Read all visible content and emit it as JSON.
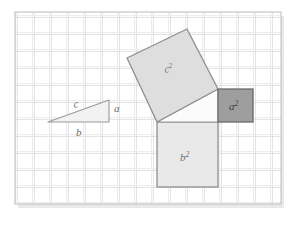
{
  "figure": {
    "background_color": "#ffffff",
    "grid": {
      "x": 15,
      "y": 12,
      "width": 266,
      "height": 192,
      "cell_size": 17.0,
      "columns": 15.6,
      "rows": 11.3,
      "line_color": "#b9bcc0",
      "highlight_line_color": "#e3e5e8",
      "fill_color": "#ffffff",
      "border_color": "#b9bcc0",
      "shadow_color": "#d8d8d8"
    },
    "shapes": {
      "small_triangle": {
        "name": "reference-right-triangle",
        "points": "48,122 109,122 109,100",
        "fill": "#f2f2f2",
        "stroke": "#9a9a9a",
        "stroke_width": 1.1
      },
      "square_c2": {
        "name": "hypotenuse-square",
        "points": "127,58 187,29 218,89 157,122",
        "fill": "#dedede",
        "stroke": "#8f8f8f",
        "stroke_width": 1.3
      },
      "square_a2": {
        "name": "side-a-square",
        "x": 218,
        "y": 89,
        "width": 35,
        "height": 33,
        "fill": "#9e9e9e",
        "stroke": "#6b6b6b",
        "stroke_width": 1.3
      },
      "square_b2": {
        "name": "side-b-square",
        "x": 157,
        "y": 122,
        "width": 61,
        "height": 65,
        "fill": "#e9e9e9",
        "stroke": "#8f8f8f",
        "stroke_width": 1.3
      },
      "center_triangle": {
        "name": "central-right-triangle",
        "points": "157,122 218,122 218,89",
        "fill": "#fbfbfb",
        "stroke": "#9a9a9a",
        "stroke_width": 1.1
      }
    },
    "labels": {
      "c": {
        "text": "c",
        "sup": "",
        "x": 74,
        "y": 108,
        "rotation": -10,
        "color": "#6e6e6e",
        "size": 11
      },
      "a": {
        "text": "a",
        "sup": "",
        "x": 114,
        "y": 112,
        "rotation": 0,
        "color": "#6e6e6e",
        "size": 11
      },
      "b": {
        "text": "b",
        "sup": "",
        "x": 76,
        "y": 136,
        "rotation": 0,
        "color": "#6e6e6e",
        "size": 11
      },
      "c2": {
        "text": "c",
        "sup": "2",
        "x": 165,
        "y": 73,
        "rotation": -10,
        "color": "#7a7a7a",
        "size": 11
      },
      "a2": {
        "text": "a",
        "sup": "2",
        "x": 229,
        "y": 110,
        "rotation": 0,
        "color": "#3f3f3f",
        "size": 11
      },
      "b2": {
        "text": "b",
        "sup": "2",
        "x": 180,
        "y": 161,
        "rotation": 0,
        "color": "#6e6e6e",
        "size": 11
      }
    }
  }
}
